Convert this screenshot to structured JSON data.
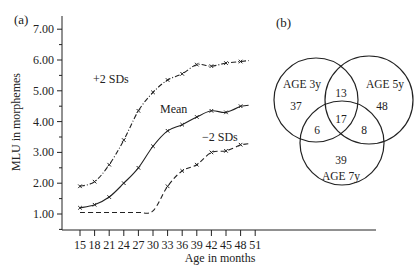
{
  "panels": {
    "a_label": "(a)",
    "b_label": "(b)"
  },
  "chart_data": [
    {
      "type": "line",
      "panel": "(a)",
      "title": "",
      "xlabel": "Age in months",
      "ylabel": "MLU in morphemes",
      "xlim": [
        15,
        51
      ],
      "ylim": [
        1.0,
        7.0
      ],
      "x_ticks": [
        "15",
        "18",
        "21",
        "24",
        "27",
        "30",
        "33",
        "36",
        "39",
        "42",
        "45",
        "48",
        "51"
      ],
      "y_ticks": [
        "1.00",
        "2.00",
        "3.00",
        "4.00",
        "5.00",
        "6.00",
        "7.00"
      ],
      "grid": false,
      "series": [
        {
          "name": "+2 SDs",
          "style": "dash-dot",
          "x": [
            15,
            18,
            21,
            24,
            27,
            30,
            33,
            36,
            39,
            42,
            45,
            48
          ],
          "values": [
            1.9,
            2.05,
            2.6,
            3.4,
            4.35,
            4.95,
            5.35,
            5.55,
            5.85,
            5.8,
            5.9,
            5.95
          ]
        },
        {
          "name": "Mean",
          "style": "solid",
          "x": [
            15,
            18,
            21,
            24,
            27,
            30,
            33,
            36,
            39,
            42,
            45,
            48
          ],
          "values": [
            1.2,
            1.3,
            1.55,
            2.0,
            2.5,
            3.2,
            3.7,
            3.9,
            4.15,
            4.35,
            4.3,
            4.5
          ]
        },
        {
          "name": "-2 SDs",
          "style": "dashed",
          "x": [
            15,
            18,
            21,
            24,
            27,
            30,
            33,
            36,
            39,
            42,
            45,
            48
          ],
          "values": [
            1.05,
            1.05,
            1.05,
            1.05,
            1.05,
            1.1,
            1.9,
            2.4,
            2.6,
            3.0,
            3.05,
            3.25
          ]
        }
      ],
      "annotations": [
        "+2 SDs",
        "Mean",
        "-2 SDs"
      ]
    },
    {
      "type": "venn",
      "panel": "(b)",
      "sets": [
        {
          "label": "AGE 3y",
          "only": "37"
        },
        {
          "label": "AGE 5y",
          "only": "48"
        },
        {
          "label": "AGE 7y",
          "only": "39"
        }
      ],
      "intersections": {
        "3y_5y": "13",
        "3y_7y": "6",
        "5y_7y": "8",
        "all": "17"
      }
    }
  ],
  "labels": {
    "plus2": "+2 SDs",
    "mean": "Mean",
    "minus2": "−2 SDs",
    "xlabel": "Age in months",
    "ylabel": "MLU in morphemes",
    "venn_3y": "AGE 3y",
    "venn_5y": "AGE 5y",
    "venn_7y": "AGE 7y",
    "n_37": "37",
    "n_48": "48",
    "n_39": "39",
    "n_13": "13",
    "n_6": "6",
    "n_8": "8",
    "n_17": "17"
  }
}
